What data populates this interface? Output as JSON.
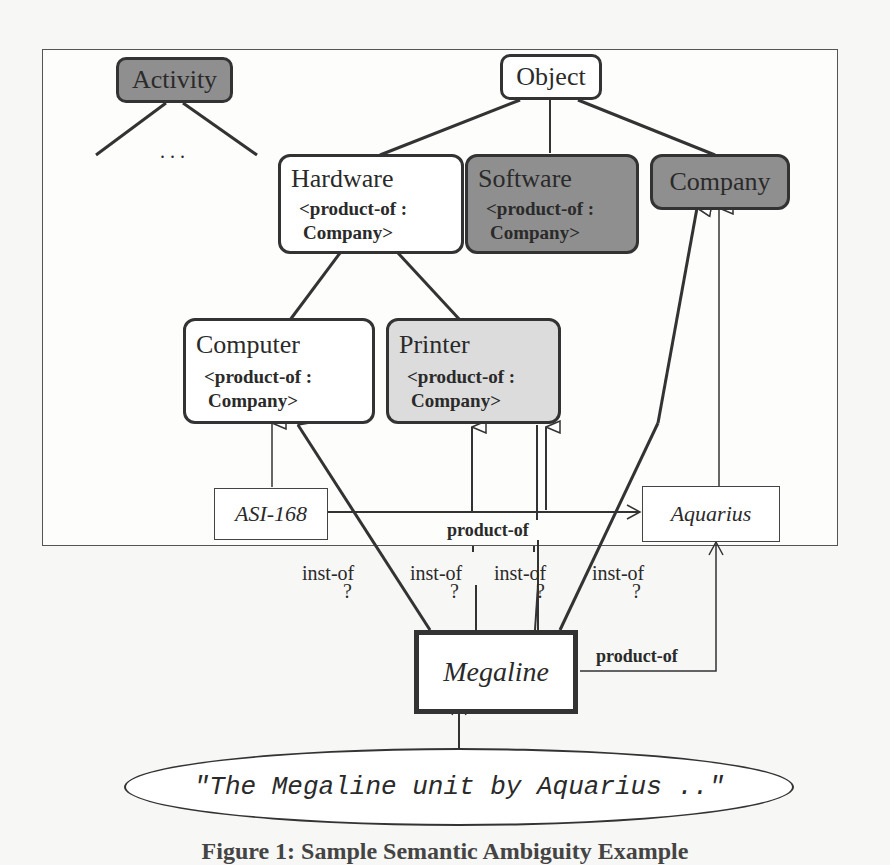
{
  "diagram": {
    "nodes": {
      "activity": {
        "title": "Activity"
      },
      "ellipsis": {
        "text": ". . ."
      },
      "object": {
        "title": "Object"
      },
      "hardware": {
        "title": "Hardware",
        "slot_line1": "<product-of :",
        "slot_line2": "Company>"
      },
      "software": {
        "title": "Software",
        "slot_line1": "<product-of :",
        "slot_line2": "Company>"
      },
      "company": {
        "title": "Company"
      },
      "computer": {
        "title": "Computer",
        "slot_line1": "<product-of :",
        "slot_line2": "Company>"
      },
      "printer": {
        "title": "Printer",
        "slot_line1": "<product-of :",
        "slot_line2": "Company>"
      }
    },
    "instances": {
      "asi168": "ASI-168",
      "aquarius": "Aquarius",
      "megaline": "Megaline"
    },
    "edge_labels": {
      "product_of_top": "product-of",
      "product_of_bottom": "product-of",
      "inst_of_1": "inst-of",
      "inst_of_2": "inst-of",
      "inst_of_3": "inst-of",
      "inst_of_4": "inst-of",
      "question_mark": "?"
    },
    "input_text": "\"The Megaline unit by Aquarius ..\"",
    "colors": {
      "dark_node": "#8f8f8f",
      "light_node": "#dcdcdc",
      "line": "#333333"
    }
  },
  "caption": "Figure 1: Sample Semantic Ambiguity Example"
}
